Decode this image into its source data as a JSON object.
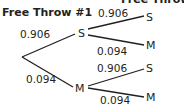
{
  "headers": {
    "throw1": "Free Throw #1",
    "throw2": "Free Throw #2"
  },
  "tree": {
    "level1": [
      {
        "outcome": "S",
        "probability": "0.906"
      },
      {
        "outcome": "M",
        "probability": "0.094"
      }
    ],
    "level2": {
      "after_S": [
        {
          "outcome": "S",
          "probability": "0.906"
        },
        {
          "outcome": "M",
          "probability": "0.094"
        }
      ],
      "after_M": [
        {
          "outcome": "S",
          "probability": "0.906"
        },
        {
          "outcome": "M",
          "probability": "0.094"
        }
      ]
    }
  },
  "colors": {
    "ink": "#231f20",
    "background": "#ffffff"
  }
}
